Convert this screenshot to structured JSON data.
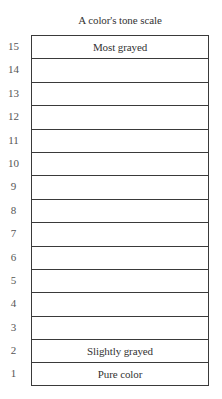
{
  "title": "A color's tone scale",
  "rows": [
    {
      "level": "15",
      "label": "Most grayed"
    },
    {
      "level": "14",
      "label": ""
    },
    {
      "level": "13",
      "label": ""
    },
    {
      "level": "12",
      "label": ""
    },
    {
      "level": "11",
      "label": ""
    },
    {
      "level": "10",
      "label": ""
    },
    {
      "level": "9",
      "label": ""
    },
    {
      "level": "8",
      "label": ""
    },
    {
      "level": "7",
      "label": ""
    },
    {
      "level": "6",
      "label": ""
    },
    {
      "level": "5",
      "label": ""
    },
    {
      "level": "4",
      "label": ""
    },
    {
      "level": "3",
      "label": ""
    },
    {
      "level": "2",
      "label": "Slightly grayed"
    },
    {
      "level": "1",
      "label": "Pure color"
    }
  ],
  "colors": {
    "line": "#3a3a3a",
    "text": "#333333",
    "background": "#ffffff"
  }
}
